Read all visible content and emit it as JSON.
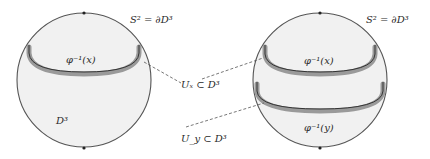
{
  "diagram": {
    "left_ball": {
      "boundary_label": "S² = ∂D³",
      "interior_label": "D³",
      "fiber_label": "φ⁻¹(x)"
    },
    "right_ball": {
      "boundary_label": "S² = ∂D³",
      "fiber_x_label": "φ⁻¹(x)",
      "fiber_y_label": "φ⁻¹(y)"
    },
    "neighborhoods": {
      "ux_label": "Uₓ ⊂ D³",
      "uy_label": "U_y ⊂ D³"
    },
    "colors": {
      "ball_fill": "#f1f1f1",
      "ball_stroke": "#555555",
      "band_color": "#9a9a9a",
      "curve_color": "#333333",
      "dash_color": "#555555"
    }
  }
}
